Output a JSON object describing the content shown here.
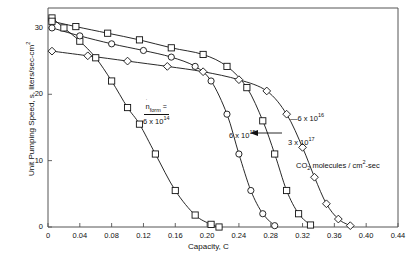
{
  "chart_data": {
    "type": "line",
    "title": "",
    "xlabel": "Capacity, C",
    "ylabel": "Unit Pumping Speed, s, liters/sec-cm",
    "ylabel_exp": "2",
    "xlim": [
      0,
      0.44
    ],
    "ylim": [
      0,
      33
    ],
    "xticks": [
      "0",
      "0.04",
      "0.08",
      "0.12",
      "0.16",
      "0.20",
      "0.24",
      "0.28",
      "0.32",
      "0.36",
      "0.40",
      "0.44"
    ],
    "xtick_values": [
      0,
      0.04,
      0.08,
      0.12,
      0.16,
      0.2,
      0.24,
      0.28,
      0.32,
      0.36,
      0.4,
      0.44
    ],
    "yticks": [
      "0",
      "10",
      "20",
      "30"
    ],
    "ytick_values": [
      0,
      10,
      20,
      30
    ],
    "grid": false,
    "legend_position": "in-plot annotations",
    "units_note": "CO",
    "units_note_sub": "2",
    "units_note_rest": " molecules / cm",
    "units_note_sup": "2",
    "units_note_tail": "-sec",
    "series": [
      {
        "name": "6 x 10^14",
        "label_base": "6 x 10",
        "label_exp": "14",
        "marker": "square",
        "x": [
          0.005,
          0.02,
          0.04,
          0.06,
          0.08,
          0.1,
          0.115,
          0.135,
          0.16,
          0.185,
          0.205,
          0.215
        ],
        "y": [
          31.5,
          30.0,
          28.0,
          25.5,
          22.0,
          18.0,
          15.5,
          11.0,
          5.5,
          1.8,
          0.4,
          0.0
        ]
      },
      {
        "name": "6 x 10^15",
        "label_base": "6 x 10",
        "label_exp": "15",
        "marker": "circle",
        "x": [
          0.005,
          0.04,
          0.08,
          0.12,
          0.155,
          0.185,
          0.205,
          0.225,
          0.24,
          0.255,
          0.27,
          0.285
        ],
        "y": [
          30.0,
          28.8,
          27.6,
          26.6,
          25.6,
          24.2,
          22.0,
          17.0,
          11.0,
          5.5,
          2.0,
          0.2
        ]
      },
      {
        "name": "6 x 10^16",
        "label_base": "6 x 10",
        "label_exp": "16",
        "marker": "square",
        "x": [
          0.005,
          0.035,
          0.075,
          0.115,
          0.155,
          0.195,
          0.225,
          0.25,
          0.27,
          0.285,
          0.3,
          0.315,
          0.33
        ],
        "y": [
          31.0,
          30.2,
          29.2,
          28.2,
          27.0,
          26.0,
          24.2,
          21.0,
          16.0,
          11.0,
          5.5,
          2.0,
          0.3
        ]
      },
      {
        "name": "3 x 10^17",
        "label_base": "3 x 10",
        "label_exp": "17",
        "marker": "diamond",
        "x": [
          0.005,
          0.05,
          0.1,
          0.15,
          0.195,
          0.24,
          0.275,
          0.3,
          0.32,
          0.335,
          0.35,
          0.365,
          0.38
        ],
        "y": [
          26.5,
          25.8,
          25.0,
          24.2,
          23.4,
          22.2,
          20.5,
          17.0,
          12.0,
          7.5,
          3.5,
          1.2,
          0.2
        ]
      }
    ],
    "annotations": [
      {
        "name": "nform-annotation",
        "numerator": "n",
        "numerator_sub": "form",
        "numerator_eq": "=",
        "denominator_base": "6 x 10",
        "denominator_exp": "14"
      },
      {
        "name": "series-label-6e15",
        "base": "6 x 10",
        "exp": "15"
      },
      {
        "name": "series-label-6e16",
        "base": "6 x 10",
        "exp": "16"
      },
      {
        "name": "series-label-3e17",
        "base": "3 x 10",
        "exp": "17"
      }
    ]
  }
}
